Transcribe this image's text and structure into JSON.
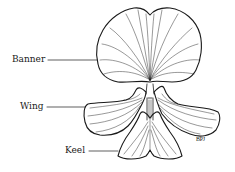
{
  "diagram": {
    "labels": [
      {
        "id": "banner",
        "text": "Banner"
      },
      {
        "id": "wing",
        "text": "Wing"
      },
      {
        "id": "keel",
        "text": "Keel"
      }
    ],
    "signature": "BPJ",
    "colors": {
      "ink": "#1a1a1a",
      "background": "#ffffff"
    }
  }
}
